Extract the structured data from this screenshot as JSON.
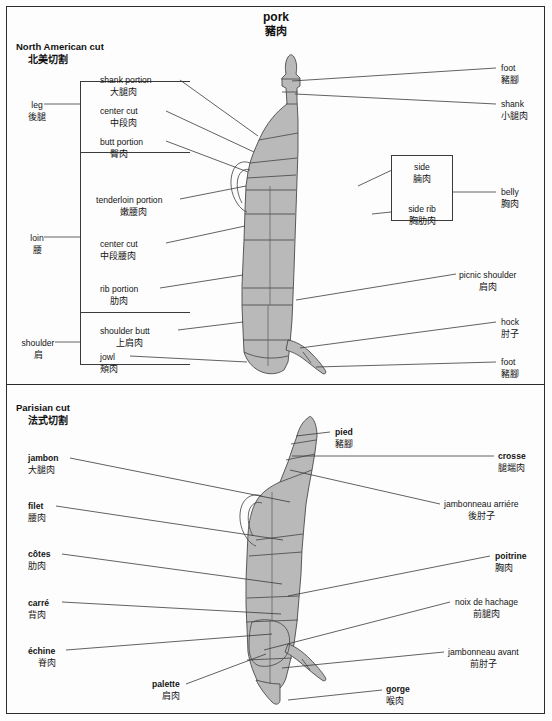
{
  "title": {
    "en": "pork",
    "zh": "豬肉"
  },
  "sections": [
    {
      "id": "north-american",
      "en": "North American cut",
      "zh": "北美切割"
    },
    {
      "id": "parisian",
      "en": "Parisian cut",
      "zh": "法式切割"
    }
  ],
  "north_american": {
    "groups": [
      {
        "id": "leg",
        "en": "leg",
        "zh": "後腿"
      },
      {
        "id": "loin",
        "en": "loin",
        "zh": "腰"
      },
      {
        "id": "shoulder",
        "en": "shoulder",
        "zh": "肩"
      }
    ],
    "left_labels": [
      {
        "id": "shank-portion",
        "en": "shank portion",
        "zh": "大腿肉"
      },
      {
        "id": "center-cut-leg",
        "en": "center cut",
        "zh": "中段肉"
      },
      {
        "id": "butt-portion",
        "en": "butt portion",
        "zh": "臀肉"
      },
      {
        "id": "tenderloin-portion",
        "en": "tenderloin portion",
        "zh": "嫩腰肉"
      },
      {
        "id": "center-cut-loin",
        "en": "center cut",
        "zh": "中段腰肉"
      },
      {
        "id": "rib-portion",
        "en": "rib portion",
        "zh": "肋肉"
      },
      {
        "id": "shoulder-butt",
        "en": "shoulder butt",
        "zh": "上肩肉"
      },
      {
        "id": "jowl",
        "en": "jowl",
        "zh": "頰肉"
      }
    ],
    "right_labels": [
      {
        "id": "foot-top",
        "en": "foot",
        "zh": "豬腳"
      },
      {
        "id": "shank",
        "en": "shank",
        "zh": "小腿肉"
      },
      {
        "id": "belly",
        "en": "belly",
        "zh": "胸肉"
      },
      {
        "id": "picnic-shoulder",
        "en": "picnic shoulder",
        "zh": "肩肉"
      },
      {
        "id": "hock",
        "en": "hock",
        "zh": "肘子"
      },
      {
        "id": "foot-bottom",
        "en": "foot",
        "zh": "豬腳"
      }
    ],
    "side_box": [
      {
        "id": "side",
        "en": "side",
        "zh": "腩肉"
      },
      {
        "id": "side-rib",
        "en": "side rib",
        "zh": "胸肋肉"
      }
    ]
  },
  "parisian": {
    "left_labels": [
      {
        "id": "jambon",
        "en": "jambon",
        "zh": "大腿肉"
      },
      {
        "id": "filet",
        "en": "filet",
        "zh": "腰肉"
      },
      {
        "id": "cotes",
        "en": "côtes",
        "zh": "肋肉"
      },
      {
        "id": "carre",
        "en": "carré",
        "zh": "背肉"
      },
      {
        "id": "echine",
        "en": "échine",
        "zh": "脊肉"
      },
      {
        "id": "palette",
        "en": "palette",
        "zh": "肩肉"
      }
    ],
    "right_labels": [
      {
        "id": "pied",
        "en": "pied",
        "zh": "豬腳"
      },
      {
        "id": "crosse",
        "en": "crosse",
        "zh": "腿端肉"
      },
      {
        "id": "jambonneau-arriere",
        "en": "jambonneau arriére",
        "zh": "後肘子"
      },
      {
        "id": "poitrine",
        "en": "poitrine",
        "zh": "胸肉"
      },
      {
        "id": "noix-de-hachage",
        "en": "noix de hachage",
        "zh": "前腿肉"
      },
      {
        "id": "jambonneau-avant",
        "en": "jambonneau avant",
        "zh": "前肘子"
      },
      {
        "id": "gorge",
        "en": "gorge",
        "zh": "喉肉"
      }
    ]
  },
  "colors": {
    "body_fill": "#b9b9b9",
    "outline": "#4a4a4a",
    "leader": "#3a3a3a",
    "frame": "#2b2b2b",
    "text": "#141414",
    "background": "#fdfdfd"
  }
}
